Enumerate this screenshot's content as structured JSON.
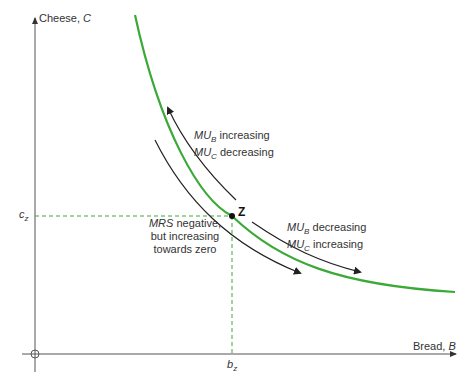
{
  "axes": {
    "y_label": "Cheese, ",
    "y_var": "C",
    "x_label": "Bread, ",
    "x_var": "B",
    "origin": "O"
  },
  "point": {
    "name": "Z",
    "c_label": "c",
    "c_sub": "z",
    "b_label": "b",
    "b_sub": "z"
  },
  "annotations": {
    "upper": {
      "line1_var": "MU",
      "line1_sub": "B",
      "line1_text": " increasing",
      "line2_var": "MU",
      "line2_sub": "C",
      "line2_text": " decreasing"
    },
    "lower_right": {
      "line1_var": "MU",
      "line1_sub": "B",
      "line1_text": " decreasing",
      "line2_var": "MU",
      "line2_sub": "C",
      "line2_text": " increasing"
    },
    "mrs": {
      "line1_var": "MRS",
      "line1_text": " negative,",
      "line2": "but increasing",
      "line3": "towards zero"
    }
  },
  "colors": {
    "curve": "#3aa935",
    "guides": "#3aa935",
    "axes": "#555555",
    "arrows": "#222222"
  }
}
